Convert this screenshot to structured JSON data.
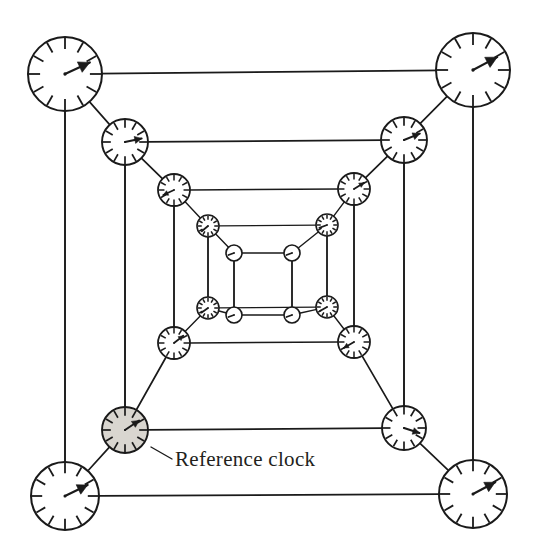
{
  "figure": {
    "background_color": "#ffffff",
    "line_color": "#1a1a1a",
    "shaded_fill_color": "#d9d6d0",
    "width": 539,
    "height": 557
  },
  "annotation": {
    "reference_clock_label": "Reference clock",
    "leader_from": [
      151,
      447
    ],
    "leader_to": [
      172,
      459
    ]
  },
  "chart_data": {
    "type": "diagram",
    "levels": [
      {
        "level": 1,
        "radius": 37,
        "tick_count": 12,
        "corners": [
          [
            65,
            74
          ],
          [
            473,
            70
          ],
          [
            473,
            494
          ],
          [
            65,
            496
          ]
        ]
      },
      {
        "level": 2,
        "radius": 23,
        "tick_count": 12,
        "corners": [
          [
            125,
            142
          ],
          [
            404,
            140
          ],
          [
            404,
            428
          ],
          [
            125,
            430
          ]
        ]
      },
      {
        "level": 3,
        "radius": 16,
        "tick_count": 12,
        "corners": [
          [
            174,
            190
          ],
          [
            354,
            189
          ],
          [
            354,
            342
          ],
          [
            174,
            343
          ]
        ]
      },
      {
        "level": 4,
        "radius": 11,
        "tick_count": 12,
        "corners": [
          [
            208,
            226
          ],
          [
            327,
            225
          ],
          [
            327,
            307
          ],
          [
            208,
            308
          ]
        ]
      },
      {
        "level": 5,
        "radius": 8,
        "tick_count": 0,
        "corners": [
          [
            234,
            253
          ],
          [
            292,
            253
          ],
          [
            292,
            315
          ],
          [
            234,
            315
          ]
        ]
      }
    ],
    "clocks": [
      {
        "id": "L1-TL",
        "level": 1,
        "corner": "top-left",
        "cx": 65,
        "cy": 74,
        "r": 37,
        "hand_angle_deg": 65,
        "shaded": false
      },
      {
        "id": "L1-TR",
        "level": 1,
        "corner": "top-right",
        "cx": 473,
        "cy": 70,
        "r": 37,
        "hand_angle_deg": 62,
        "shaded": false
      },
      {
        "id": "L1-BR",
        "level": 1,
        "corner": "bottom-right",
        "cx": 473,
        "cy": 494,
        "r": 34,
        "hand_angle_deg": 62,
        "shaded": false
      },
      {
        "id": "L1-BL",
        "level": 1,
        "corner": "bottom-left",
        "cx": 65,
        "cy": 496,
        "r": 34,
        "hand_angle_deg": 64,
        "shaded": false
      },
      {
        "id": "L2-TL",
        "level": 2,
        "corner": "top-left",
        "cx": 125,
        "cy": 142,
        "r": 23,
        "hand_angle_deg": 78,
        "shaded": false
      },
      {
        "id": "L2-TR",
        "level": 2,
        "corner": "top-right",
        "cx": 404,
        "cy": 140,
        "r": 23,
        "hand_angle_deg": 68,
        "shaded": false
      },
      {
        "id": "L2-BR",
        "level": 2,
        "corner": "bottom-right",
        "cx": 404,
        "cy": 428,
        "r": 22,
        "hand_angle_deg": 108,
        "shaded": false
      },
      {
        "id": "L2-BL",
        "level": 2,
        "corner": "bottom-left",
        "cx": 125,
        "cy": 430,
        "r": 23,
        "hand_angle_deg": 56,
        "shaded": true
      },
      {
        "id": "L3-TL",
        "level": 3,
        "corner": "top-left",
        "cx": 174,
        "cy": 190,
        "r": 16,
        "hand_angle_deg": 245,
        "shaded": false
      },
      {
        "id": "L3-TR",
        "level": 3,
        "corner": "top-right",
        "cx": 354,
        "cy": 189,
        "r": 16,
        "hand_angle_deg": 58,
        "shaded": false
      },
      {
        "id": "L3-BR",
        "level": 3,
        "corner": "bottom-right",
        "cx": 354,
        "cy": 342,
        "r": 16,
        "hand_angle_deg": 240,
        "shaded": false
      },
      {
        "id": "L3-BL",
        "level": 3,
        "corner": "bottom-left",
        "cx": 174,
        "cy": 343,
        "r": 16,
        "hand_angle_deg": 52,
        "shaded": false
      },
      {
        "id": "L4-TL",
        "level": 4,
        "corner": "top-left",
        "cx": 208,
        "cy": 226,
        "r": 11,
        "hand_angle_deg": 230,
        "shaded": false
      },
      {
        "id": "L4-TR",
        "level": 4,
        "corner": "top-right",
        "cx": 327,
        "cy": 225,
        "r": 11,
        "hand_angle_deg": 250,
        "shaded": false
      },
      {
        "id": "L4-BR",
        "level": 4,
        "corner": "bottom-right",
        "cx": 327,
        "cy": 307,
        "r": 11,
        "hand_angle_deg": 240,
        "shaded": false
      },
      {
        "id": "L4-BL",
        "level": 4,
        "corner": "bottom-left",
        "cx": 208,
        "cy": 308,
        "r": 11,
        "hand_angle_deg": 235,
        "shaded": false
      },
      {
        "id": "L5-TL",
        "level": 5,
        "corner": "top-left",
        "cx": 234,
        "cy": 253,
        "r": 8,
        "hand_angle_deg": 250,
        "shaded": false
      },
      {
        "id": "L5-TR",
        "level": 5,
        "corner": "top-right",
        "cx": 292,
        "cy": 253,
        "r": 8,
        "hand_angle_deg": 250,
        "shaded": false
      },
      {
        "id": "L5-BR",
        "level": 5,
        "corner": "bottom-right",
        "cx": 292,
        "cy": 315,
        "r": 8,
        "hand_angle_deg": 250,
        "shaded": false
      },
      {
        "id": "L5-BL",
        "level": 5,
        "corner": "bottom-left",
        "cx": 234,
        "cy": 315,
        "r": 8,
        "hand_angle_deg": 250,
        "shaded": false
      }
    ],
    "extra_edges": [
      {
        "from": [
          65,
          74
        ],
        "to": [
          65,
          496
        ],
        "name": "outer-left-vertical"
      },
      {
        "from": [
          473,
          70
        ],
        "to": [
          473,
          494
        ],
        "name": "outer-right-vertical"
      },
      {
        "from": [
          125,
          142
        ],
        "to": [
          125,
          430
        ],
        "name": "level2-left-vertical"
      },
      {
        "from": [
          404,
          140
        ],
        "to": [
          404,
          428
        ],
        "name": "level2-right-vertical"
      },
      {
        "from": [
          174,
          190
        ],
        "to": [
          174,
          343
        ],
        "name": "level3-left-vertical"
      },
      {
        "from": [
          354,
          189
        ],
        "to": [
          354,
          342
        ],
        "name": "level3-right-vertical"
      },
      {
        "from": [
          208,
          226
        ],
        "to": [
          208,
          308
        ],
        "name": "level4-left-vertical"
      },
      {
        "from": [
          327,
          225
        ],
        "to": [
          327,
          307
        ],
        "name": "level4-right-vertical"
      },
      {
        "from": [
          234,
          253
        ],
        "to": [
          234,
          315
        ],
        "name": "level5-left-vertical"
      },
      {
        "from": [
          292,
          253
        ],
        "to": [
          292,
          315
        ],
        "name": "level5-right-vertical"
      }
    ]
  }
}
